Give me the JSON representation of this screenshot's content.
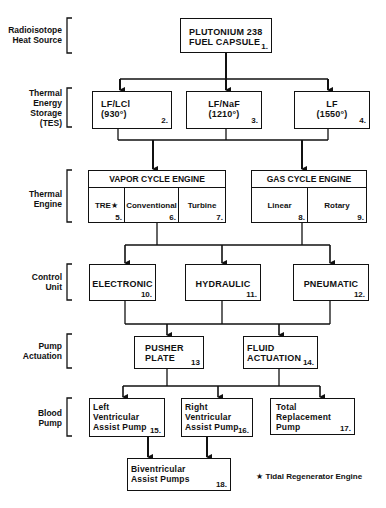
{
  "levels": {
    "heat_source": "Radioisotope\nHeat Source",
    "tes": "Thermal\nEnergy\nStorage\n(TES)",
    "engine": "Thermal\nEngine",
    "control": "Control\nUnit",
    "actuation": "Pump\nActuation",
    "blood_pump": "Blood\nPump"
  },
  "nodes": {
    "n1": {
      "text": "PLUTONIUM 238\nFUEL CAPSULE",
      "num": "1."
    },
    "n2": {
      "text": "LF/LCl\n(930°)",
      "num": "2."
    },
    "n3": {
      "text": "LF/NaF\n(1210°)",
      "num": "3."
    },
    "n4": {
      "text": "LF\n(1550°)",
      "num": "4."
    },
    "vapor": {
      "title": "VAPOR CYCLE ENGINE"
    },
    "n5": {
      "text": "TRE★",
      "num": "5."
    },
    "n6": {
      "text": "Conventional",
      "num": "6."
    },
    "n7": {
      "text": "Turbine",
      "num": "7."
    },
    "gas": {
      "title": "GAS CYCLE ENGINE"
    },
    "n8": {
      "text": "Linear",
      "num": "8."
    },
    "n9": {
      "text": "Rotary",
      "num": "9."
    },
    "n10": {
      "text": "ELECTRONIC",
      "num": "10."
    },
    "n11": {
      "text": "HYDRAULIC",
      "num": "11."
    },
    "n12": {
      "text": "PNEUMATIC",
      "num": "12."
    },
    "n13": {
      "text": "PUSHER\nPLATE",
      "num": "13"
    },
    "n14": {
      "text": "FLUID\nACTUATION",
      "num": "14."
    },
    "n15": {
      "text": "Left\nVentricular\nAssist Pump",
      "num": "15."
    },
    "n16": {
      "text": "Right\nVentricular\nAssist Pump",
      "num": "16."
    },
    "n17": {
      "text": "Total\nReplacement\nPump",
      "num": "17."
    },
    "n18": {
      "text": "Biventricular\nAssist Pumps",
      "num": "18."
    }
  },
  "footnote": "★ Tidal Regenerator Engine",
  "colors": {
    "ink": "#111111",
    "paper": "#ffffff"
  }
}
